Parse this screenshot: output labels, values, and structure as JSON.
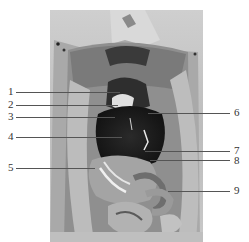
{
  "figure": {
    "colors": {
      "background": "#ffffff",
      "label_text": "#333333",
      "leader_line": "#555555"
    },
    "labels_left": [
      {
        "id": "1",
        "text": "1",
        "y": 92,
        "line_end_x": 120
      },
      {
        "id": "2",
        "text": "2",
        "y": 105,
        "line_end_x": 118
      },
      {
        "id": "3",
        "text": "3",
        "y": 117,
        "line_end_x": 115
      },
      {
        "id": "4",
        "text": "4",
        "y": 137,
        "line_end_x": 122
      },
      {
        "id": "5",
        "text": "5",
        "y": 168,
        "line_end_x": 95
      }
    ],
    "labels_right": [
      {
        "id": "6",
        "text": "6",
        "y": 113,
        "line_start_x": 148
      },
      {
        "id": "7",
        "text": "7",
        "y": 151,
        "line_start_x": 145
      },
      {
        "id": "8",
        "text": "8",
        "y": 160,
        "line_start_x": 150
      },
      {
        "id": "9",
        "text": "9",
        "y": 191,
        "line_start_x": 168
      }
    ]
  }
}
